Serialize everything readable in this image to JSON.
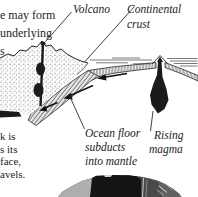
{
  "colors": {
    "ink": "#1e1e1e",
    "paper": "#ffffff"
  },
  "text_fragments": {
    "top_left": [
      "e may form",
      "underlying",
      "s"
    ],
    "bottom_left": [
      "k is",
      "s its",
      "face,",
      "avels."
    ]
  },
  "labels": {
    "volcano": "Volcano",
    "continental_crust": [
      "Continental",
      "crust"
    ],
    "ocean_floor": [
      "Ocean floor",
      "subducts",
      "into mantle"
    ],
    "rising_magma": [
      "Rising",
      "magma"
    ]
  }
}
